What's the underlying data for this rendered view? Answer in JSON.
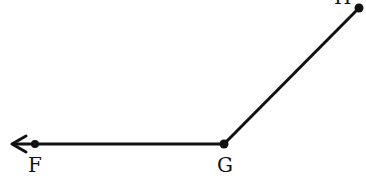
{
  "diagram": {
    "stroke_color": "#111111",
    "points": {
      "F": {
        "label": "F",
        "x": 35,
        "y": 144
      },
      "G": {
        "label": "G",
        "x": 224,
        "y": 144
      },
      "H": {
        "label": "H",
        "x": 359,
        "y": 8
      }
    },
    "ray_arrow_tip": {
      "x": 12,
      "y": 144
    }
  }
}
